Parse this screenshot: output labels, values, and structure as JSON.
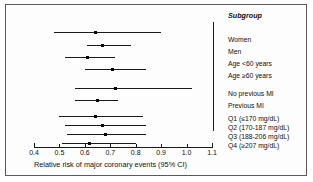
{
  "chart_data": {
    "type": "forest",
    "title": "",
    "xlabel": "Relative risk of major coronary events (95% CI)",
    "ylabel": "",
    "xlim": [
      0.4,
      1.1
    ],
    "xticks": [
      "0.4",
      "0.5",
      "0.6",
      "0.7",
      "0.8",
      "0.9",
      "1.0",
      "1.1"
    ],
    "xtick_values": [
      0.4,
      0.5,
      0.6,
      0.7,
      0.8,
      0.9,
      1.0,
      1.1
    ],
    "grid": false,
    "legend": "none",
    "reference_line": 1.0,
    "header": "Subgroup",
    "rows": [
      {
        "label": "Women",
        "estimate": 0.64,
        "low": 0.48,
        "high": 0.9
      },
      {
        "label": "Men",
        "estimate": 0.67,
        "low": 0.61,
        "high": 0.78
      },
      {
        "label": "Age <60 years",
        "estimate": 0.61,
        "low": 0.52,
        "high": 0.72
      },
      {
        "label": "Age ≥60 years",
        "estimate": 0.71,
        "low": 0.6,
        "high": 0.84
      },
      {
        "label": "No previous MI",
        "estimate": 0.72,
        "low": 0.56,
        "high": 1.02
      },
      {
        "label": "Previous MI",
        "estimate": 0.65,
        "low": 0.56,
        "high": 0.73
      },
      {
        "label": "Q1 (≤170 mg/dL)",
        "estimate": 0.64,
        "low": 0.5,
        "high": 0.83
      },
      {
        "label": "Q2 (170-187 mg/dL)",
        "estimate": 0.67,
        "low": 0.52,
        "high": 0.84
      },
      {
        "label": "Q3 (188-206 mg/dL)",
        "estimate": 0.68,
        "low": 0.53,
        "high": 0.84
      },
      {
        "label": "Q4 (≥207 mg/dL)",
        "estimate": 0.62,
        "low": 0.51,
        "high": 0.8
      }
    ],
    "row_y": [
      32,
      45,
      57,
      69,
      88,
      100,
      116,
      125,
      134,
      143
    ],
    "label_y": [
      36,
      48,
      60,
      72,
      90,
      102,
      115,
      124,
      133,
      142
    ],
    "colors": {
      "line": "#1a1a1a",
      "marker": "#000000",
      "text": "#111111",
      "frame": "#5a5a5a",
      "background": "#ffffff"
    }
  }
}
